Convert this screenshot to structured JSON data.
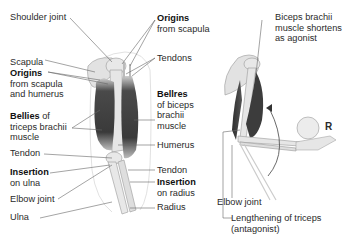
{
  "left_figure": {
    "labels": {
      "shoulder_joint": "Shoulder joint",
      "scapula": "Scapula",
      "origins_scapula_humerus_bold": "Origins",
      "origins_scapula_humerus_rest1": "from scapula",
      "origins_scapula_humerus_rest2": "and humerus",
      "bellies_triceps_bold": "Bellies",
      "bellies_triceps_rest0": " of",
      "bellies_triceps_rest1": "triceps brachii",
      "bellies_triceps_rest2": "muscle",
      "tendon_left": "Tendon",
      "insertion_ulna_bold": "Insertion",
      "insertion_ulna_rest": "on ulna",
      "elbow_joint": "Elbow joint",
      "ulna": "Ulna",
      "origins_scapula_bold": "Origins",
      "origins_scapula_rest": "from scapula",
      "tendons": "Tendons",
      "bellies_biceps_bold": "Bellres",
      "bellies_biceps_rest1": "of biceps",
      "bellies_biceps_rest2": "brachii",
      "bellies_biceps_rest3": "muscle",
      "humerus": "Humerus",
      "tendon_right": "Tendon",
      "insertion_radius_bold": "Insertion",
      "insertion_radius_rest": "on radius",
      "radius": "Radius"
    }
  },
  "right_figure": {
    "labels": {
      "biceps_line1": "Biceps brachii",
      "biceps_line2": "muscle shortens",
      "biceps_line3": "as agonist",
      "resistance": "R",
      "elbow_joint": "Elbow joint",
      "triceps_line1": "Lengthening of triceps",
      "triceps_line2": "(antagonist)"
    }
  },
  "colors": {
    "muscle_dark": "#3a3a3a",
    "muscle_mid": "#5a5a5a",
    "bone": "#e4e4e4",
    "bone_outline": "#9a9a9a",
    "skin_outline": "#cfcfcf",
    "leader_line": "#666666"
  }
}
